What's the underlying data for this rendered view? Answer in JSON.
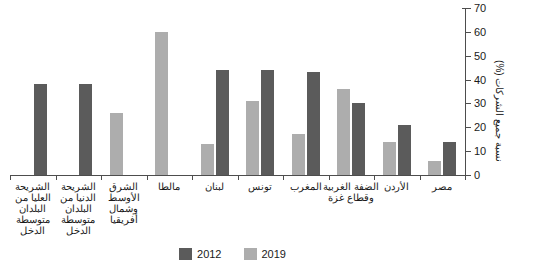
{
  "chart_data": {
    "type": "bar",
    "title": "",
    "xlabel": "",
    "ylabel": "نسبة جميع الشركات (%)",
    "ylim": [
      0,
      70
    ],
    "ytick_step": 10,
    "yticks": [
      0,
      10,
      20,
      30,
      40,
      50,
      60,
      70
    ],
    "ytick_labels": [
      "0",
      "10",
      "20",
      "30",
      "40",
      "50",
      "60",
      "70"
    ],
    "grid": false,
    "y_axis_position": "right",
    "direction": "rtl",
    "legend_position": "bottom-center",
    "categories": [
      "الشريحة العليا من البلدان متوسطة الدخل",
      "الشريحة الدنيا من البلدان متوسطة الدخل",
      "الشرق الأوسط وشمال أفريقيا",
      "مالطا",
      "لبنان",
      "تونس",
      "المغرب",
      "الضفة الغربية وقطاع غزة",
      "الأردن",
      "مصر"
    ],
    "series": [
      {
        "name": "2019",
        "color": "#adadad",
        "values": [
          null,
          null,
          26,
          60,
          13,
          31,
          17,
          36,
          14,
          6
        ]
      },
      {
        "name": "2012",
        "color": "#5b5b5b",
        "values": [
          38,
          38,
          null,
          null,
          44,
          44,
          43,
          30,
          21,
          14
        ]
      }
    ]
  },
  "legend": {
    "entries": [
      {
        "label": "2019",
        "swatch": "legend-swatch-2019"
      },
      {
        "label": "2012",
        "swatch": "legend-swatch-2012"
      }
    ]
  },
  "colors": {
    "series_2019": "#adadad",
    "series_2012": "#5b5b5b",
    "axis": "#4d4d4d",
    "text": "#1a1a1a",
    "background": "#ffffff"
  }
}
